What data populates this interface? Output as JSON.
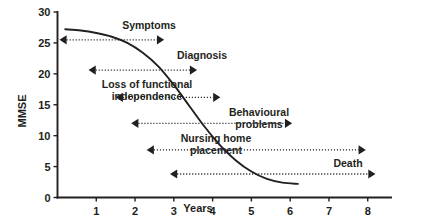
{
  "chart_data": {
    "type": "line",
    "title": "",
    "xlabel": "Years",
    "ylabel": "MMSE",
    "xlim": [
      0,
      8.6
    ],
    "ylim": [
      0,
      30
    ],
    "grid": false,
    "legend_position": "none",
    "x_ticks": [
      1,
      2,
      3,
      4,
      5,
      6,
      7,
      8
    ],
    "x_tick_labels": [
      "1",
      "2",
      "3",
      "4",
      "5",
      "6",
      "7",
      "8"
    ],
    "y_ticks": [
      0,
      5,
      10,
      15,
      20,
      25,
      30
    ],
    "y_tick_labels": [
      "0",
      "5",
      "10",
      "15",
      "20",
      "25",
      "30"
    ],
    "series": [
      {
        "name": "MMSE decline",
        "x": [
          0.2,
          0.6,
          1.0,
          1.4,
          1.8,
          2.2,
          2.6,
          3.0,
          3.4,
          3.8,
          4.2,
          4.6,
          5.0,
          5.4,
          5.8,
          6.2
        ],
        "y": [
          27.2,
          27.0,
          26.6,
          26.0,
          25.0,
          23.4,
          21.2,
          18.2,
          14.8,
          11.4,
          8.4,
          6.0,
          4.2,
          3.0,
          2.4,
          2.2
        ]
      }
    ],
    "annotations": [
      {
        "label": "Symptoms",
        "lines": [
          "Symptoms"
        ],
        "x_start": 0.05,
        "x_end": 2.75,
        "y": 25.5,
        "arrow_start": true,
        "arrow_end": true
      },
      {
        "label": "Diagnosis",
        "lines": [
          "Diagnosis"
        ],
        "x_start": 0.8,
        "x_end": 3.6,
        "y": 20.6,
        "arrow_start": true,
        "arrow_end": true
      },
      {
        "label": "Loss of functional independence",
        "lines": [
          "Loss of functional",
          "independence"
        ],
        "x_start": 1.5,
        "x_end": 4.2,
        "y": 16.2,
        "arrow_start": true,
        "arrow_end": true
      },
      {
        "label": "Behavioural problems",
        "lines": [
          "Behavioural",
          "problems"
        ],
        "x_start": 1.9,
        "x_end": 6.05,
        "y": 12.0,
        "arrow_start": true,
        "arrow_end": true
      },
      {
        "label": "Nursing home placement",
        "lines": [
          "Nursing home",
          "placement"
        ],
        "x_start": 2.3,
        "x_end": 7.95,
        "y": 7.7,
        "arrow_start": true,
        "arrow_end": true
      },
      {
        "label": "Death",
        "lines": [
          "Death"
        ],
        "x_start": 2.9,
        "x_end": 8.2,
        "y": 3.8,
        "arrow_start": true,
        "arrow_end": true
      }
    ],
    "annotation_label_positions": [
      {
        "label": "Symptoms",
        "x": 149,
        "y": 20
      },
      {
        "label": "Diagnosis",
        "x": 202,
        "y": 50
      },
      {
        "label": "Loss of functional independence",
        "x": 147,
        "y": 79
      },
      {
        "label": "Behavioural problems",
        "x": 259,
        "y": 107
      },
      {
        "label": "Nursing home placement",
        "x": 216,
        "y": 133
      },
      {
        "label": "Death",
        "x": 348,
        "y": 158
      }
    ],
    "colors": {
      "ink": "#231f20",
      "background": "#ffffff"
    }
  }
}
